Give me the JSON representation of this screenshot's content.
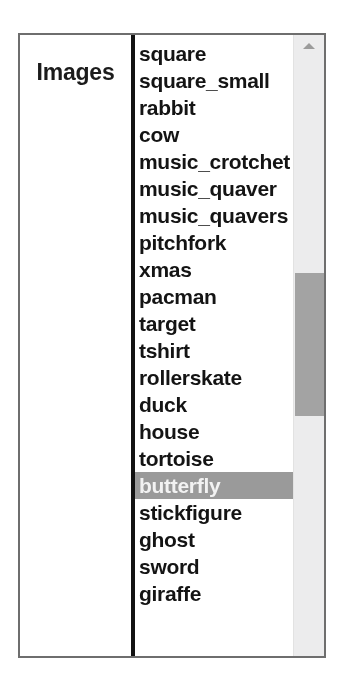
{
  "table": {
    "row_label": "Images"
  },
  "listbox": {
    "name": "images-listbox",
    "selected_value": "butterfly",
    "options": [
      {
        "label": "square",
        "selected": false
      },
      {
        "label": "square_small",
        "selected": false
      },
      {
        "label": "rabbit",
        "selected": false
      },
      {
        "label": "cow",
        "selected": false
      },
      {
        "label": "music_crotchet",
        "selected": false
      },
      {
        "label": "music_quaver",
        "selected": false
      },
      {
        "label": "music_quavers",
        "selected": false
      },
      {
        "label": "pitchfork",
        "selected": false
      },
      {
        "label": "xmas",
        "selected": false
      },
      {
        "label": "pacman",
        "selected": false
      },
      {
        "label": "target",
        "selected": false
      },
      {
        "label": "tshirt",
        "selected": false
      },
      {
        "label": "rollerskate",
        "selected": false
      },
      {
        "label": "duck",
        "selected": false
      },
      {
        "label": "house",
        "selected": false
      },
      {
        "label": "tortoise",
        "selected": false
      },
      {
        "label": "butterfly",
        "selected": true
      },
      {
        "label": "stickfigure",
        "selected": false
      },
      {
        "label": "ghost",
        "selected": false
      },
      {
        "label": "sword",
        "selected": false
      },
      {
        "label": "giraffe",
        "selected": false
      }
    ]
  },
  "scrollbar": {
    "up_button_icon": "caret-up-icon",
    "thumb_top_px": 238,
    "thumb_height_px": 143
  },
  "colors": {
    "selection_background": "#9a9a9a",
    "selection_text": "#f2f2f2",
    "frame_border": "#6e6e6e",
    "divider": "#121212",
    "scroll_track": "#ececed",
    "scroll_thumb": "#a3a3a3",
    "text": "#141414"
  }
}
